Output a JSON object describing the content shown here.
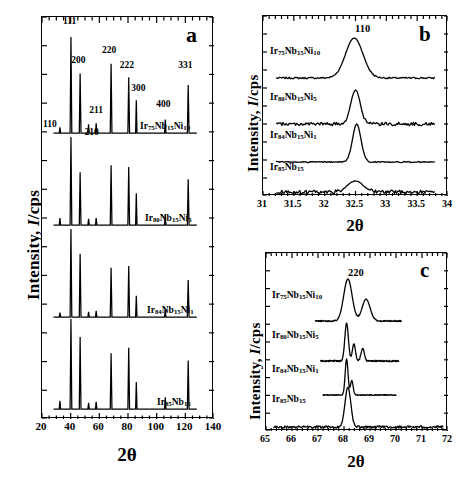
{
  "figure": {
    "type": "xrd-multipanel-figure",
    "background": "#ffffff",
    "line_color": "#000000"
  },
  "chart_data": [
    {
      "id": "panel-a",
      "type": "line",
      "panel_letter": "a",
      "title": "",
      "xlabel": "2θ",
      "ylabel": "Intensity, I/cps",
      "xlim": [
        20,
        140
      ],
      "ylim": [
        0,
        1
      ],
      "xticks": [
        20,
        40,
        60,
        80,
        100,
        120,
        140
      ],
      "xticklabels": [
        "20",
        "40",
        "60",
        "80",
        "100",
        "120",
        "140"
      ],
      "minor_ticks": true,
      "grid": false,
      "legend": "inline-trace-labels",
      "peak_labels": [
        {
          "hkl": "110",
          "two_theta": 32.5
        },
        {
          "hkl": "111",
          "two_theta": 40.2
        },
        {
          "hkl": "200",
          "two_theta": 46.6
        },
        {
          "hkl": "210",
          "two_theta": 52.5
        },
        {
          "hkl": "211",
          "two_theta": 57.8
        },
        {
          "hkl": "220",
          "two_theta": 68.2
        },
        {
          "hkl": "222",
          "two_theta": 80.5
        },
        {
          "hkl": "300",
          "two_theta": 85.8
        },
        {
          "hkl": "400",
          "two_theta": 106.0
        },
        {
          "hkl": "331",
          "two_theta": 122.0
        }
      ],
      "series": [
        {
          "name": "Ir75Nb15Ni10",
          "label_html": "Ir<sub>75</sub>Nb<sub>15</sub>Ni<sub>10</sub>",
          "peaks": [
            {
              "x": 32.5,
              "h": 0.06
            },
            {
              "x": 40.2,
              "h": 1.0
            },
            {
              "x": 46.6,
              "h": 0.62
            },
            {
              "x": 52.5,
              "h": 0.09
            },
            {
              "x": 57.8,
              "h": 0.1
            },
            {
              "x": 68.2,
              "h": 0.72
            },
            {
              "x": 80.5,
              "h": 0.58
            },
            {
              "x": 85.8,
              "h": 0.34
            },
            {
              "x": 106.0,
              "h": 0.14
            },
            {
              "x": 122.0,
              "h": 0.5
            }
          ]
        },
        {
          "name": "Ir80Nb15Ni5",
          "label_html": "Ir<sub>80</sub>Nb<sub>15</sub>Ni<sub>5</sub>",
          "peaks": [
            {
              "x": 32.5,
              "h": 0.08
            },
            {
              "x": 40.2,
              "h": 1.0
            },
            {
              "x": 46.6,
              "h": 0.6
            },
            {
              "x": 52.5,
              "h": 0.07
            },
            {
              "x": 57.8,
              "h": 0.08
            },
            {
              "x": 68.2,
              "h": 0.68
            },
            {
              "x": 80.5,
              "h": 0.66
            },
            {
              "x": 85.8,
              "h": 0.36
            },
            {
              "x": 106.0,
              "h": 0.12
            },
            {
              "x": 122.0,
              "h": 0.52
            }
          ]
        },
        {
          "name": "Ir84Nb15Ni1",
          "label_html": "Ir<sub>84</sub>Nb<sub>15</sub>Ni<sub>1</sub>",
          "peaks": [
            {
              "x": 32.5,
              "h": 0.05
            },
            {
              "x": 40.2,
              "h": 1.0
            },
            {
              "x": 46.6,
              "h": 0.72
            },
            {
              "x": 52.5,
              "h": 0.06
            },
            {
              "x": 57.8,
              "h": 0.07
            },
            {
              "x": 68.2,
              "h": 0.56
            },
            {
              "x": 80.5,
              "h": 0.58
            },
            {
              "x": 85.8,
              "h": 0.24
            },
            {
              "x": 106.0,
              "h": 0.09
            },
            {
              "x": 122.0,
              "h": 0.42
            }
          ]
        },
        {
          "name": "Ir85Nb15",
          "label_html": "Ir<sub>85</sub>Nb<sub>15</sub>",
          "peaks": [
            {
              "x": 32.5,
              "h": 0.09
            },
            {
              "x": 40.2,
              "h": 1.0
            },
            {
              "x": 46.6,
              "h": 0.8
            },
            {
              "x": 52.5,
              "h": 0.07
            },
            {
              "x": 57.8,
              "h": 0.08
            },
            {
              "x": 68.2,
              "h": 0.62
            },
            {
              "x": 80.5,
              "h": 0.68
            },
            {
              "x": 85.8,
              "h": 0.3
            },
            {
              "x": 106.0,
              "h": 0.13
            },
            {
              "x": 122.0,
              "h": 0.54
            }
          ]
        }
      ]
    },
    {
      "id": "panel-b",
      "type": "line",
      "panel_letter": "b",
      "title": "",
      "xlabel": "2θ",
      "ylabel": "Intensity, I/cps",
      "xlim": [
        31,
        34
      ],
      "xticks": [
        31,
        31.5,
        32,
        32.5,
        33,
        33.5,
        34
      ],
      "xticklabels": [
        "31",
        "31.5",
        "32",
        "32.5",
        "33",
        "33.5",
        "34"
      ],
      "minor_ticks": true,
      "grid": false,
      "peak_labels": [
        {
          "hkl": "110",
          "two_theta": 32.5
        }
      ],
      "series": [
        {
          "name": "Ir75Nb15Ni10",
          "label_html": "Ir<sub>75</sub>Nb<sub>15</sub>Ni<sub>10</sub>",
          "peak_center": 32.48,
          "peak_height": 1.0,
          "fwhm": 0.33,
          "noise": 0.02
        },
        {
          "name": "Ir80Nb15Ni5",
          "label_html": "Ir<sub>80</sub>Nb<sub>15</sub>Ni<sub>5</sub>",
          "peak_center": 32.5,
          "peak_height": 1.0,
          "fwhm": 0.18,
          "noise": 0.05
        },
        {
          "name": "Ir84Nb15Ni1",
          "label_html": "Ir<sub>84</sub>Nb<sub>15</sub>Ni<sub>1</sub>",
          "peak_center": 32.52,
          "peak_height": 1.0,
          "fwhm": 0.16,
          "noise": 0.015
        },
        {
          "name": "Ir85Nb15",
          "label_html": "Ir<sub>85</sub>Nb<sub>15</sub>",
          "peak_center": 32.5,
          "peak_height": 0.55,
          "fwhm": 0.3,
          "noise": 0.09
        }
      ]
    },
    {
      "id": "panel-c",
      "type": "line",
      "panel_letter": "c",
      "title": "",
      "xlabel": "2θ",
      "ylabel": "Intensity, I/cps",
      "xlim": [
        65,
        72
      ],
      "xticks": [
        65,
        66,
        67,
        68,
        69,
        70,
        71,
        72
      ],
      "xticklabels": [
        "65",
        "66",
        "67",
        "68",
        "69",
        "70",
        "71",
        "72"
      ],
      "minor_ticks": true,
      "grid": false,
      "peak_labels": [
        {
          "hkl": "220",
          "two_theta": 68.2
        }
      ],
      "series": [
        {
          "name": "Ir75Nb15Ni10",
          "label_html": "Ir<sub>75</sub>Nb<sub>15</sub>Ni<sub>10</sub>",
          "components": [
            {
              "center": 68.15,
              "height": 1.0,
              "fwhm": 0.38
            },
            {
              "center": 68.85,
              "height": 0.52,
              "fwhm": 0.36
            }
          ],
          "noise": 0.015
        },
        {
          "name": "Ir80Nb15Ni5",
          "label_html": "Ir<sub>80</sub>Nb<sub>15</sub>Ni<sub>5</sub>",
          "components": [
            {
              "center": 68.1,
              "height": 1.0,
              "fwhm": 0.16
            },
            {
              "center": 68.38,
              "height": 0.45,
              "fwhm": 0.14
            },
            {
              "center": 68.72,
              "height": 0.33,
              "fwhm": 0.15
            }
          ],
          "noise": 0.02
        },
        {
          "name": "Ir84Nb15Ni1",
          "label_html": "Ir<sub>84</sub>Nb<sub>15</sub>Ni<sub>1</sub>",
          "components": [
            {
              "center": 68.1,
              "height": 1.0,
              "fwhm": 0.13
            },
            {
              "center": 68.3,
              "height": 0.4,
              "fwhm": 0.12
            }
          ],
          "noise": 0.012
        },
        {
          "name": "Ir85Nb15",
          "label_html": "Ir<sub>85</sub>Nb<sub>15</sub>",
          "components": [
            {
              "center": 68.15,
              "height": 1.0,
              "fwhm": 0.26
            }
          ],
          "noise": 0.03
        }
      ]
    }
  ],
  "panel_a": {
    "letter": "a",
    "xlabel": "2θ",
    "ylabel_pre": "Intensity, ",
    "ylabel_it": "I",
    "ylabel_post": "/cps",
    "xticklabels": [
      "20",
      "40",
      "60",
      "80",
      "100",
      "120",
      "140"
    ],
    "hkl": [
      "110",
      "111",
      "200",
      "210",
      "211",
      "220",
      "222",
      "300",
      "400",
      "331"
    ],
    "traces": [
      {
        "el1": "Ir",
        "s1": "75",
        "el2": "Nb",
        "s2": "15",
        "el3": "Ni",
        "s3": "10"
      },
      {
        "el1": "Ir",
        "s1": "80",
        "el2": "Nb",
        "s2": "15",
        "el3": "Ni",
        "s3": "5"
      },
      {
        "el1": "Ir",
        "s1": "84",
        "el2": "Nb",
        "s2": "15",
        "el3": "Ni",
        "s3": "1"
      },
      {
        "el1": "Ir",
        "s1": "85",
        "el2": "Nb",
        "s2": "15",
        "el3": "",
        "s3": ""
      }
    ]
  },
  "panel_b": {
    "letter": "b",
    "xlabel": "2θ",
    "ylabel_pre": "Intensity, ",
    "ylabel_it": "I",
    "ylabel_post": "/cps",
    "xticklabels": [
      "31",
      "31.5",
      "32",
      "32.5",
      "33",
      "33.5",
      "34"
    ],
    "hkl": [
      "110"
    ],
    "traces": [
      {
        "el1": "Ir",
        "s1": "75",
        "el2": "Nb",
        "s2": "15",
        "el3": "Ni",
        "s3": "10"
      },
      {
        "el1": "Ir",
        "s1": "80",
        "el2": "Nb",
        "s2": "15",
        "el3": "Ni",
        "s3": "5"
      },
      {
        "el1": "Ir",
        "s1": "84",
        "el2": "Nb",
        "s2": "15",
        "el3": "Ni",
        "s3": "1"
      },
      {
        "el1": "Ir",
        "s1": "85",
        "el2": "Nb",
        "s2": "15",
        "el3": "",
        "s3": ""
      }
    ]
  },
  "panel_c": {
    "letter": "c",
    "xlabel": "2θ",
    "ylabel_pre": "Intensity, ",
    "ylabel_it": "I",
    "ylabel_post": "/cps",
    "xticklabels": [
      "65",
      "66",
      "67",
      "68",
      "69",
      "70",
      "71",
      "72"
    ],
    "hkl": [
      "220"
    ],
    "traces": [
      {
        "el1": "Ir",
        "s1": "75",
        "el2": "Nb",
        "s2": "15",
        "el3": "Ni",
        "s3": "10"
      },
      {
        "el1": "Ir",
        "s1": "80",
        "el2": "Nb",
        "s2": "15",
        "el3": "Ni",
        "s3": "5"
      },
      {
        "el1": "Ir",
        "s1": "84",
        "el2": "Nb",
        "s2": "15",
        "el3": "Ni",
        "s3": "1"
      },
      {
        "el1": "Ir",
        "s1": "85",
        "el2": "Nb",
        "s2": "15",
        "el3": "",
        "s3": ""
      }
    ]
  }
}
